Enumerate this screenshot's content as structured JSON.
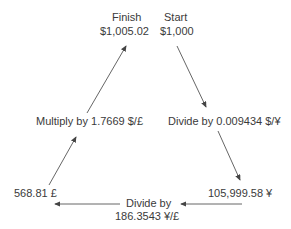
{
  "diagram": {
    "type": "currency-arbitrage-cycle",
    "nodes": {
      "finish": {
        "title": "Finish",
        "value": "$1,005.02"
      },
      "start": {
        "title": "Start",
        "value": "$1,000"
      },
      "yen": {
        "value": "105,999.58 ¥"
      },
      "pound": {
        "value": "568.81 £"
      }
    },
    "edges": {
      "start_to_yen": {
        "label": "Divide by 0.009434 $/¥"
      },
      "yen_to_pound": {
        "label_line1": "Divide by",
        "label_line2": "186.3543 ¥/£"
      },
      "pound_to_finish": {
        "label": "Multiply by 1.7669 $/£"
      }
    },
    "colors": {
      "text": "#3a3a3a",
      "arrow": "#444444",
      "background": "#ffffff"
    }
  }
}
